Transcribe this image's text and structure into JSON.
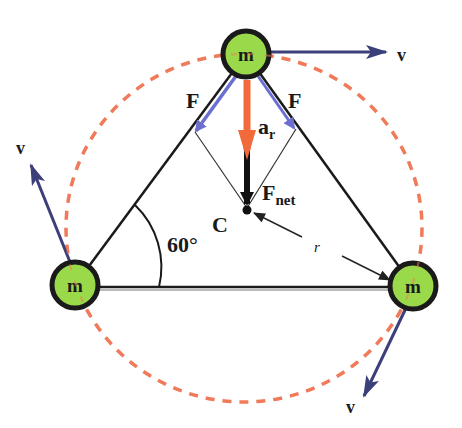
{
  "diagram": {
    "colors": {
      "background": "#ffffff",
      "mass_fill": "#9ad94a",
      "mass_stroke": "#1a1a1a",
      "orbit": "#f07a5a",
      "velocity": "#3b3f7a",
      "force": "#6b6fd0",
      "acceleration": "#f26a3a",
      "net_force": "#111111",
      "line": "#1a1a1a"
    },
    "masses": [
      {
        "id": "top",
        "label": "m",
        "cx": 246,
        "cy": 54,
        "r": 24
      },
      {
        "id": "left",
        "label": "m",
        "cx": 75,
        "cy": 285,
        "r": 24
      },
      {
        "id": "right",
        "label": "m",
        "cx": 413,
        "cy": 286,
        "r": 24
      }
    ],
    "orbit": {
      "cx": 244,
      "cy": 228,
      "rx": 178,
      "ry": 174
    },
    "labels": {
      "force_left": "F",
      "force_right": "F",
      "accel": "a",
      "accel_sub": "r",
      "net_force": "F",
      "net_force_sub": "net",
      "center": "C",
      "angle": "60°",
      "radius": "r",
      "velocity_top": "v",
      "velocity_left": "v",
      "velocity_right": "v"
    }
  }
}
